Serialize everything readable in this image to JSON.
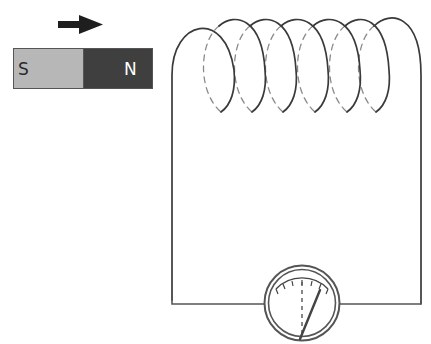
{
  "diagram": {
    "magnet": {
      "south_label": "S",
      "north_label": "N",
      "south_color": "#b7b7b7",
      "north_color": "#3f3f3f",
      "outline_color": "#555555"
    },
    "motion_arrow": {
      "direction": "right",
      "color": "#1e1e1e"
    },
    "coil": {
      "turns": 7,
      "wire_color": "#3a3a3a",
      "hidden_color": "#8a8a8a"
    },
    "circuit": {
      "wire_color": "#555555"
    },
    "galvanometer": {
      "icon": "galvanometer-icon",
      "needle_state": "deflected-right",
      "ring_color": "#555555"
    }
  }
}
